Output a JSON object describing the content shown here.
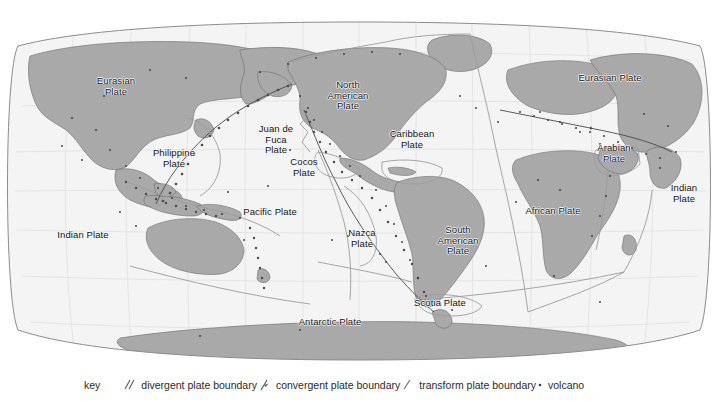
{
  "figure": {
    "projection": "robinson-oval"
  },
  "colors": {
    "land": "#a9a9a9",
    "land_stroke": "#6e6e6e",
    "ocean": "#f4f4f4",
    "graticule": "#d8d8d8",
    "plate_boundary": "#9a9a9a",
    "coast_detail": "#4a4a4a",
    "volcano": "#3a3a3a",
    "text": "#111111",
    "frame": "#8c8c8c",
    "background": "#ffffff"
  },
  "plates": [
    {
      "name": "Eurasian Plate",
      "label": "Eurasian\nPlate",
      "x": 116,
      "y": 86
    },
    {
      "name": "Philippine Plate",
      "label": "Philippine\nPlate",
      "x": 174,
      "y": 158
    },
    {
      "name": "Indian Plate West",
      "label": "Indian Plate",
      "x": 83,
      "y": 235
    },
    {
      "name": "Juan de Fuca Plate",
      "label": "Juan de\nFuca\nPlate",
      "x": 276,
      "y": 140
    },
    {
      "name": "Cocos Plate",
      "label": "Cocos\nPlate",
      "x": 304,
      "y": 167
    },
    {
      "name": "North American Plate",
      "label": "North\nAmerican\nPlate",
      "x": 348,
      "y": 96
    },
    {
      "name": "Caribbean Plate",
      "label": "Caribbean\nPlate",
      "x": 412,
      "y": 139
    },
    {
      "name": "Pacific Plate",
      "label": "Pacific Plate",
      "x": 270,
      "y": 212
    },
    {
      "name": "Nazca Plate",
      "label": "Nazca\nPlate",
      "x": 362,
      "y": 238
    },
    {
      "name": "South American Plate",
      "label": "South\nAmerican\nPlate",
      "x": 458,
      "y": 241
    },
    {
      "name": "African Plate",
      "label": "African Plate",
      "x": 553,
      "y": 211
    },
    {
      "name": "Arabian Plate",
      "label": "Arabian\nPlate",
      "x": 614,
      "y": 153
    },
    {
      "name": "Eurasian Plate East",
      "label": "Eurasian Plate",
      "x": 610,
      "y": 78
    },
    {
      "name": "Indian Plate East",
      "label": "Indian\nPlate",
      "x": 684,
      "y": 193
    },
    {
      "name": "Scotia Plate",
      "label": "Scotia Plate",
      "x": 440,
      "y": 303
    },
    {
      "name": "Antarctic Plate",
      "label": "Antarctic Plate",
      "x": 330,
      "y": 322
    }
  ],
  "legend": {
    "key_label": "key",
    "entries": [
      {
        "icon": "divergent-boundary-icon",
        "label": "divergent plate boundary"
      },
      {
        "icon": "convergent-boundary-icon",
        "label": "convergent plate boundary"
      },
      {
        "icon": "transform-boundary-icon",
        "label": "transform plate boundary"
      },
      {
        "icon": "volcano-icon",
        "label": "volcano"
      }
    ]
  }
}
